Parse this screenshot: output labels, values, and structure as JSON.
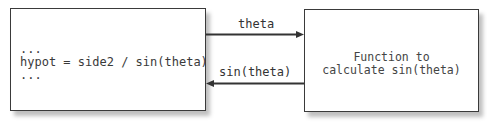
{
  "left_box": {
    "lines": [
      "...",
      "hypot = side2 / sin(theta)",
      "..."
    ]
  },
  "right_box": {
    "lines": [
      "Function to",
      "calculate sin(theta)"
    ]
  },
  "arrows": {
    "top": {
      "label": "theta",
      "direction": "right"
    },
    "bottom": {
      "label": "sin(theta)",
      "direction": "left"
    }
  },
  "colors": {
    "stroke": "#333333",
    "background": "#ffffff"
  }
}
